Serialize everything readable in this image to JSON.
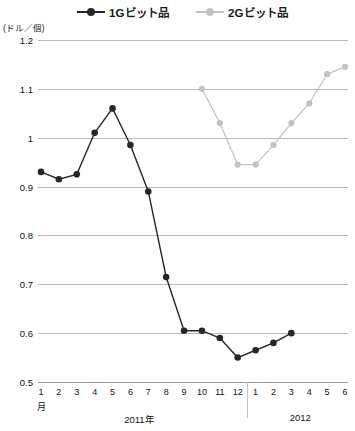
{
  "chart_data": {
    "type": "line",
    "title": "",
    "xlabel": "月",
    "ylabel": "(ドル／個)",
    "unit_note": "(ドル／個)",
    "ylim": [
      0.5,
      1.2
    ],
    "ytick_labels": [
      "1.2",
      "1.1",
      "1",
      "0.9",
      "0.8",
      "0.7",
      "0.6",
      "0.5"
    ],
    "ytick_values": [
      1.2,
      1.1,
      1.0,
      0.9,
      0.8,
      0.7,
      0.6,
      0.5
    ],
    "grid": true,
    "legend_position": "top",
    "x": [
      "1",
      "2",
      "3",
      "4",
      "5",
      "6",
      "7",
      "8",
      "9",
      "10",
      "11",
      "12",
      "1",
      "2",
      "3",
      "4",
      "5",
      "6"
    ],
    "categories": [
      "2011-1",
      "2011-2",
      "2011-3",
      "2011-4",
      "2011-5",
      "2011-6",
      "2011-7",
      "2011-8",
      "2011-9",
      "2011-10",
      "2011-11",
      "2011-12",
      "2012-1",
      "2012-2",
      "2012-3",
      "2012-4",
      "2012-5",
      "2012-6"
    ],
    "period_groups": [
      {
        "label": "2011年",
        "start_index": 0,
        "end_index": 11
      },
      {
        "label": "2012",
        "start_index": 12,
        "end_index": 17
      }
    ],
    "series": [
      {
        "name": "1Gビット品",
        "color": "#262626",
        "values": [
          0.93,
          0.915,
          0.925,
          1.01,
          1.06,
          0.985,
          0.89,
          0.715,
          0.605,
          0.605,
          0.59,
          0.55,
          0.565,
          0.58,
          0.6,
          null,
          null,
          null
        ]
      },
      {
        "name": "2Gビット品",
        "color": "#c2c2c2",
        "values": [
          null,
          null,
          null,
          null,
          null,
          null,
          null,
          null,
          null,
          1.1,
          1.03,
          0.945,
          0.945,
          0.985,
          1.03,
          1.07,
          1.13,
          1.145
        ]
      }
    ]
  },
  "legend": {
    "items": [
      {
        "label": "1Gビット品",
        "color": "#262626"
      },
      {
        "label": "2Gビット品",
        "color": "#c2c2c2"
      }
    ]
  },
  "axis": {
    "unit": "(ドル／個)",
    "month_unit": "月"
  },
  "footnote": {
    "text": ""
  }
}
